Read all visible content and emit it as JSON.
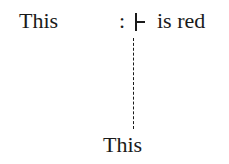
{
  "diagram": {
    "subject_top": "This",
    "colon": ":",
    "turnstile_symbol": "turnstile",
    "predicate": "is red",
    "subject_bottom": "This",
    "connector": "dashed-vertical-line"
  }
}
